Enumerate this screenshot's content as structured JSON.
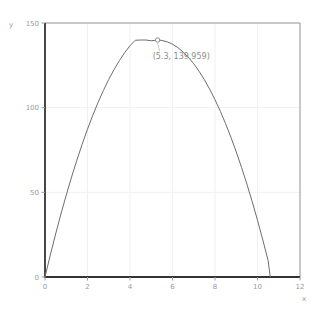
{
  "chart_data": {
    "type": "line",
    "title": "",
    "subtitle": "",
    "xlabel": "x",
    "ylabel": "y",
    "xlim": [
      0,
      12
    ],
    "ylim": [
      0,
      150
    ],
    "grid": true,
    "legend": null,
    "xticks": [
      "0",
      "2",
      "4",
      "6",
      "8",
      "10",
      "12"
    ],
    "xtick_values": [
      0,
      2,
      4,
      6,
      8,
      10,
      12
    ],
    "yticks": [
      "0",
      "50",
      "100",
      "150"
    ],
    "ytick_values": [
      0,
      50,
      100,
      150
    ],
    "series": [
      {
        "name": "curve",
        "color": "#6e6e6e",
        "x": [
          0,
          0.25,
          0.5,
          0.75,
          1,
          1.25,
          1.5,
          1.75,
          2,
          2.25,
          2.5,
          2.75,
          3,
          3.25,
          3.5,
          3.75,
          4,
          4.25,
          4.5,
          4.75,
          5,
          5.3,
          5.5,
          5.75,
          6,
          6.25,
          6.5,
          6.75,
          7,
          7.25,
          7.5,
          7.75,
          8,
          8.25,
          8.5,
          8.75,
          9,
          9.25,
          9.5,
          9.75,
          10,
          10.25,
          10.5,
          10.6
        ],
        "y": [
          0,
          13.0,
          25.4,
          37.2,
          48.4,
          59.0,
          69.0,
          78.5,
          87.3,
          95.5,
          103.2,
          110.2,
          116.7,
          122.5,
          127.8,
          132.5,
          136.6,
          139.8,
          139.96,
          139.96,
          139.5,
          139.959,
          139.7,
          138.9,
          137.5,
          135.5,
          132.9,
          129.7,
          125.9,
          121.5,
          116.5,
          110.9,
          104.7,
          97.9,
          90.5,
          82.5,
          73.9,
          64.7,
          54.9,
          44.5,
          33.5,
          21.9,
          9.7,
          0
        ]
      }
    ],
    "annotations": [
      {
        "label": "(5.3, 139.959)",
        "x": 5.3,
        "y": 139.959,
        "marker": "open-circle",
        "marker_color": "#8d8d8d"
      }
    ],
    "colors": {
      "curve": "#6e6e6e",
      "axis": "#333333",
      "frame": "#9a9a9a",
      "grid": "#f0f0f0",
      "tick_text": "#9a9a9a",
      "annotation_text": "#8d8d8d",
      "background": "#ffffff"
    }
  }
}
